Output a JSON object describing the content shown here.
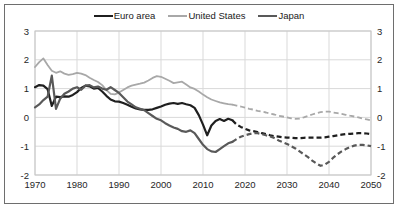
{
  "chart_data": {
    "type": "line",
    "title": "",
    "xlabel": "",
    "ylabel": "",
    "xlim": [
      1970,
      2050
    ],
    "ylim": [
      -2,
      3
    ],
    "x_ticks": [
      1970,
      1980,
      1990,
      2000,
      2010,
      2020,
      2030,
      2040,
      2050
    ],
    "y_ticks": [
      -2,
      -1,
      0,
      1,
      2,
      3
    ],
    "y_axis_both_sides": true,
    "grid": true,
    "grid_color": "#d9d9d9",
    "frame_color": "#c6c6c6",
    "legend_position": "top-center",
    "solid_until_year": 2017,
    "dash_note": "lines are solid through 2017 (history) and dashed 2017-2050 (projections)",
    "years": [
      1970,
      1971,
      1972,
      1973,
      1974,
      1975,
      1976,
      1977,
      1978,
      1979,
      1980,
      1981,
      1982,
      1983,
      1984,
      1985,
      1986,
      1987,
      1988,
      1989,
      1990,
      1991,
      1992,
      1993,
      1994,
      1995,
      1996,
      1997,
      1998,
      1999,
      2000,
      2001,
      2002,
      2003,
      2004,
      2005,
      2006,
      2007,
      2008,
      2009,
      2010,
      2011,
      2012,
      2013,
      2014,
      2015,
      2016,
      2017,
      2018,
      2019,
      2020,
      2021,
      2022,
      2023,
      2024,
      2025,
      2026,
      2027,
      2028,
      2029,
      2030,
      2031,
      2032,
      2033,
      2034,
      2035,
      2036,
      2037,
      2038,
      2039,
      2040,
      2041,
      2042,
      2043,
      2044,
      2045,
      2046,
      2047,
      2048,
      2049,
      2050
    ],
    "series": [
      {
        "name": "Euro area",
        "color": "#1f1f1f",
        "width": 2.2,
        "values": [
          1.05,
          1.12,
          1.1,
          0.98,
          0.4,
          0.72,
          0.7,
          0.73,
          0.72,
          0.78,
          0.88,
          1.02,
          1.1,
          1.08,
          1.0,
          1.02,
          0.9,
          0.75,
          0.62,
          0.56,
          0.55,
          0.5,
          0.44,
          0.37,
          0.31,
          0.28,
          0.26,
          0.26,
          0.28,
          0.33,
          0.38,
          0.44,
          0.48,
          0.5,
          0.47,
          0.5,
          0.46,
          0.42,
          0.33,
          0.08,
          -0.25,
          -0.62,
          -0.28,
          -0.12,
          -0.06,
          -0.12,
          -0.05,
          -0.1,
          -0.25,
          -0.33,
          -0.4,
          -0.45,
          -0.48,
          -0.51,
          -0.55,
          -0.58,
          -0.62,
          -0.65,
          -0.67,
          -0.69,
          -0.7,
          -0.71,
          -0.72,
          -0.72,
          -0.71,
          -0.7,
          -0.7,
          -0.7,
          -0.7,
          -0.69,
          -0.67,
          -0.65,
          -0.62,
          -0.6,
          -0.58,
          -0.57,
          -0.56,
          -0.55,
          -0.55,
          -0.56,
          -0.58
        ]
      },
      {
        "name": "United States",
        "color": "#a8a8a8",
        "width": 1.8,
        "values": [
          1.75,
          1.92,
          2.05,
          1.82,
          1.62,
          1.55,
          1.6,
          1.52,
          1.48,
          1.5,
          1.55,
          1.52,
          1.47,
          1.38,
          1.3,
          1.23,
          1.12,
          0.95,
          0.82,
          0.8,
          0.86,
          0.95,
          1.04,
          1.1,
          1.14,
          1.17,
          1.21,
          1.28,
          1.37,
          1.43,
          1.41,
          1.34,
          1.27,
          1.19,
          1.22,
          1.24,
          1.14,
          1.04,
          0.99,
          0.9,
          0.79,
          0.7,
          0.62,
          0.57,
          0.52,
          0.49,
          0.46,
          0.44,
          0.41,
          0.38,
          0.34,
          0.3,
          0.27,
          0.23,
          0.2,
          0.17,
          0.13,
          0.1,
          0.06,
          0.03,
          0.0,
          -0.03,
          -0.05,
          -0.04,
          0.0,
          0.05,
          0.1,
          0.15,
          0.18,
          0.2,
          0.2,
          0.17,
          0.15,
          0.12,
          0.09,
          0.06,
          0.03,
          0.0,
          -0.04,
          -0.07,
          -0.1
        ]
      },
      {
        "name": "Japan",
        "color": "#595959",
        "width": 2.2,
        "values": [
          0.35,
          0.45,
          0.6,
          0.72,
          1.45,
          0.3,
          0.65,
          0.82,
          0.9,
          1.0,
          1.05,
          0.96,
          1.1,
          1.12,
          1.04,
          1.07,
          1.0,
          0.96,
          1.05,
          0.95,
          0.85,
          0.7,
          0.55,
          0.45,
          0.35,
          0.3,
          0.25,
          0.15,
          0.05,
          -0.05,
          -0.1,
          -0.2,
          -0.28,
          -0.35,
          -0.4,
          -0.48,
          -0.5,
          -0.45,
          -0.55,
          -0.75,
          -0.95,
          -1.1,
          -1.18,
          -1.2,
          -1.1,
          -1.0,
          -0.9,
          -0.85,
          -0.75,
          -0.67,
          -0.62,
          -0.58,
          -0.55,
          -0.55,
          -0.58,
          -0.62,
          -0.66,
          -0.72,
          -0.8,
          -0.86,
          -0.92,
          -1.0,
          -1.08,
          -1.18,
          -1.28,
          -1.38,
          -1.5,
          -1.6,
          -1.68,
          -1.64,
          -1.54,
          -1.4,
          -1.28,
          -1.18,
          -1.1,
          -1.03,
          -0.98,
          -0.95,
          -0.95,
          -0.97,
          -1.0
        ]
      }
    ]
  }
}
